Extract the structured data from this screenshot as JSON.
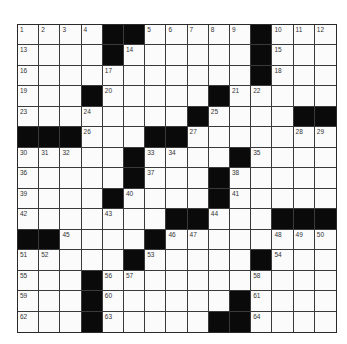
{
  "puzzle": {
    "rows": 15,
    "cols": 15,
    "grid": [
      [
        "1",
        "2",
        "3",
        "4",
        "#",
        "#",
        "5",
        "6",
        "7",
        "8",
        "9",
        "#",
        "10",
        "11",
        "12"
      ],
      [
        "13",
        "",
        "",
        "",
        "#",
        "14",
        "",
        "",
        "",
        "",
        "",
        "#",
        "15",
        "",
        ""
      ],
      [
        "16",
        "",
        "",
        "",
        "17",
        "",
        "",
        "",
        "",
        "",
        "",
        "#",
        "18",
        "",
        ""
      ],
      [
        "19",
        "",
        "",
        "#",
        "20",
        "",
        "",
        "",
        "",
        "#",
        "21",
        "22",
        "",
        "",
        ""
      ],
      [
        "23",
        "",
        "",
        "24",
        "",
        "",
        "",
        "",
        "#",
        "25",
        "",
        "",
        "",
        "#",
        "#"
      ],
      [
        "#",
        "#",
        "#",
        "26",
        "",
        "",
        "#",
        "#",
        "27",
        "",
        "",
        "",
        "",
        "28",
        "29"
      ],
      [
        "30",
        "31",
        "32",
        "",
        "",
        "#",
        "33",
        "34",
        "",
        "",
        "#",
        "35",
        "",
        "",
        ""
      ],
      [
        "36",
        "",
        "",
        "",
        "",
        "#",
        "37",
        "",
        "",
        "#",
        "38",
        "",
        "",
        "",
        ""
      ],
      [
        "39",
        "",
        "",
        "",
        "#",
        "40",
        "",
        "",
        "",
        "#",
        "41",
        "",
        "",
        "",
        ""
      ],
      [
        "42",
        "",
        "",
        "",
        "43",
        "",
        "",
        "#",
        "#",
        "44",
        "",
        "",
        "#",
        "#",
        "#"
      ],
      [
        "#",
        "#",
        "45",
        "",
        "",
        "",
        "#",
        "46",
        "47",
        "",
        "",
        "",
        "48",
        "49",
        "50"
      ],
      [
        "51",
        "52",
        "",
        "",
        "",
        "#",
        "53",
        "",
        "",
        "",
        "",
        "#",
        "54",
        "",
        ""
      ],
      [
        "55",
        "",
        "",
        "#",
        "56",
        "57",
        "",
        "",
        "",
        "",
        "",
        "58",
        "",
        "",
        ""
      ],
      [
        "59",
        "",
        "",
        "#",
        "60",
        "",
        "",
        "",
        "",
        "",
        "#",
        "61",
        "",
        "",
        ""
      ],
      [
        "62",
        "",
        "",
        "#",
        "63",
        "",
        "",
        "",
        "",
        "#",
        "#",
        "64",
        "",
        "",
        ""
      ]
    ]
  }
}
